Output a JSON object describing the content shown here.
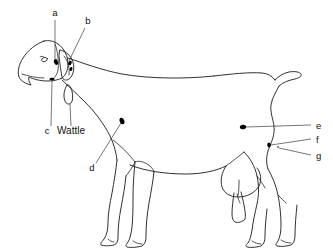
{
  "diagram": {
    "title": "",
    "background_color": "#ffffff",
    "line_color": "#1a1a1a",
    "marker_color": "#000000"
  },
  "labels": [
    {
      "id": "a",
      "text": "a",
      "x": 55,
      "y": 16,
      "target_x": 55,
      "target_y": 62,
      "kind": "letter"
    },
    {
      "id": "b",
      "text": "b",
      "x": 88,
      "y": 24,
      "target_x": 68,
      "target_y": 62,
      "kind": "letter"
    },
    {
      "id": "c",
      "text": "c",
      "x": 47,
      "y": 131,
      "target_x": 52,
      "target_y": 79,
      "kind": "letter"
    },
    {
      "id": "wattle",
      "text": "Wattle",
      "x": 61,
      "y": 131,
      "target_x": 71,
      "target_y": 105,
      "kind": "word"
    },
    {
      "id": "d",
      "text": "d",
      "x": 92,
      "y": 168,
      "target_x": 122,
      "target_y": 121,
      "kind": "letter"
    },
    {
      "id": "e",
      "text": "e",
      "x": 318,
      "y": 128,
      "target_x": 243,
      "target_y": 127,
      "kind": "letter"
    },
    {
      "id": "f",
      "text": "f",
      "x": 318,
      "y": 143,
      "target_x": 269,
      "target_y": 145,
      "kind": "letter"
    },
    {
      "id": "g",
      "text": "g",
      "x": 318,
      "y": 158,
      "target_x": 276,
      "target_y": 147,
      "kind": "letter"
    }
  ],
  "markers": [
    {
      "id": "marker-a-horn-bud",
      "x": 56,
      "y": 62,
      "rx": 2.0,
      "ry": 3.0,
      "rot": -18
    },
    {
      "id": "marker-b-ear-tag",
      "x": 70,
      "y": 63,
      "rx": 1.6,
      "ry": 2.4,
      "rot": 25
    },
    {
      "id": "marker-b-lower",
      "x": 71,
      "y": 69,
      "rx": 1.4,
      "ry": 2.0,
      "rot": 20
    },
    {
      "id": "marker-c-muzzle",
      "x": 52,
      "y": 79,
      "rx": 2.6,
      "ry": 1.3,
      "rot": 0
    },
    {
      "id": "marker-d-shoulder",
      "x": 122,
      "y": 121,
      "rx": 2.3,
      "ry": 3.4,
      "rot": -20
    },
    {
      "id": "marker-e-flank",
      "x": 243,
      "y": 127,
      "rx": 3.2,
      "ry": 2.3,
      "rot": -10
    },
    {
      "id": "marker-f-thigh",
      "x": 269,
      "y": 145,
      "rx": 1.8,
      "ry": 2.4,
      "rot": -10
    },
    {
      "id": "marker-g-dot",
      "x": 278,
      "y": 147,
      "rx": 0.8,
      "ry": 0.8,
      "rot": 0
    }
  ],
  "anatomy_parts": [
    "head",
    "ear",
    "eye",
    "muzzle",
    "wattle",
    "neck",
    "withers",
    "back",
    "tail",
    "shoulder",
    "foreleg",
    "barrel",
    "belly",
    "udder",
    "hindleg",
    "hoof"
  ]
}
